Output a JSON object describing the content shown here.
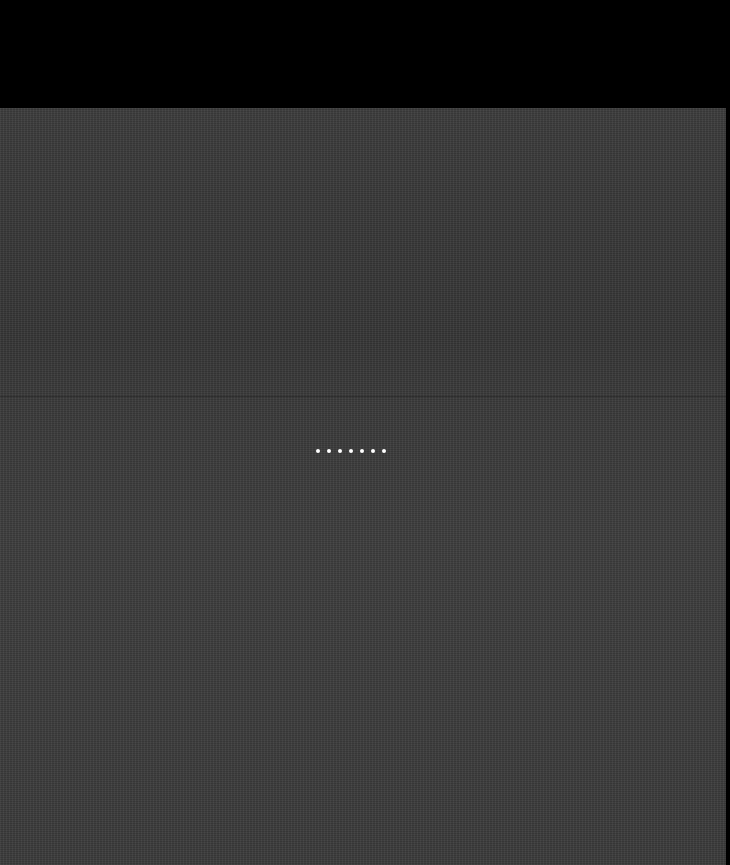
{
  "screen": {
    "state": "loading",
    "top_band_color": "#000000",
    "background_color": "#3a3a3a"
  },
  "loading_indicator": {
    "type": "dots",
    "dot_count": 7,
    "dot_color": "#ffffff"
  }
}
